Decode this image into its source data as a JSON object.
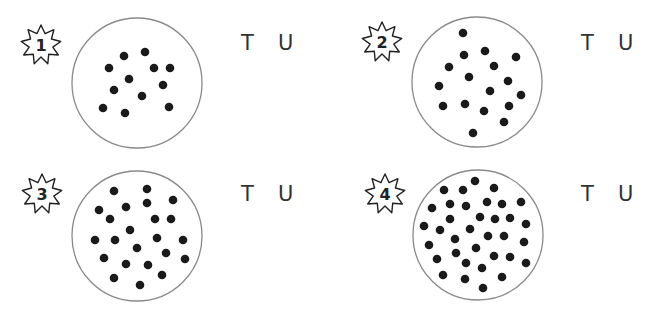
{
  "worksheet": {
    "colors": {
      "dot": "#1a1a1a",
      "circle_stroke": "#8a8a8a",
      "text": "#333333",
      "badge_stroke": "#222222"
    },
    "panels": [
      {
        "number": "1",
        "labels": {
          "tens": "T",
          "units": "U"
        },
        "dot_count": 12,
        "badge": {
          "cx": 41,
          "cy": 45
        },
        "circle": {
          "cx": 137,
          "cy": 83,
          "r": 65
        },
        "tu_pos": {
          "x": 241,
          "y": 31
        },
        "dots": [
          [
            124,
            56
          ],
          [
            145,
            52
          ],
          [
            109,
            68
          ],
          [
            154,
            68
          ],
          [
            170,
            68
          ],
          [
            129,
            79
          ],
          [
            163,
            85
          ],
          [
            114,
            90
          ],
          [
            142,
            96
          ],
          [
            103,
            108
          ],
          [
            125,
            113
          ],
          [
            169,
            107
          ]
        ]
      },
      {
        "number": "2",
        "labels": {
          "tens": "T",
          "units": "U"
        },
        "dot_count": 17,
        "badge": {
          "cx": 382,
          "cy": 42
        },
        "circle": {
          "cx": 477,
          "cy": 82,
          "r": 65
        },
        "tu_pos": {
          "x": 581,
          "y": 31
        },
        "dots": [
          [
            463,
            33
          ],
          [
            464,
            55
          ],
          [
            485,
            51
          ],
          [
            516,
            57
          ],
          [
            449,
            67
          ],
          [
            494,
            66
          ],
          [
            469,
            77
          ],
          [
            439,
            86
          ],
          [
            508,
            81
          ],
          [
            490,
            91
          ],
          [
            521,
            95
          ],
          [
            443,
            106
          ],
          [
            465,
            104
          ],
          [
            484,
            111
          ],
          [
            509,
            106
          ],
          [
            504,
            122
          ],
          [
            473,
            133
          ]
        ]
      },
      {
        "number": "3",
        "labels": {
          "tens": "T",
          "units": "U"
        },
        "dot_count": 23,
        "badge": {
          "cx": 42,
          "cy": 194
        },
        "circle": {
          "cx": 137,
          "cy": 236,
          "r": 65
        },
        "tu_pos": {
          "x": 241,
          "y": 182
        },
        "dots": [
          [
            114,
            191
          ],
          [
            147,
            189
          ],
          [
            173,
            200
          ],
          [
            99,
            210
          ],
          [
            126,
            207
          ],
          [
            147,
            203
          ],
          [
            110,
            219
          ],
          [
            155,
            219
          ],
          [
            171,
            219
          ],
          [
            130,
            230
          ],
          [
            95,
            240
          ],
          [
            115,
            240
          ],
          [
            157,
            238
          ],
          [
            183,
            240
          ],
          [
            137,
            248
          ],
          [
            166,
            253
          ],
          [
            104,
            258
          ],
          [
            126,
            264
          ],
          [
            148,
            265
          ],
          [
            185,
            259
          ],
          [
            114,
            278
          ],
          [
            162,
            275
          ],
          [
            140,
            285
          ]
        ]
      },
      {
        "number": "4",
        "labels": {
          "tens": "T",
          "units": "U"
        },
        "dot_count": 35,
        "badge": {
          "cx": 385,
          "cy": 194
        },
        "circle": {
          "cx": 478,
          "cy": 235,
          "r": 65
        },
        "tu_pos": {
          "x": 581,
          "y": 182
        },
        "dots": [
          [
            475,
            181
          ],
          [
            444,
            190
          ],
          [
            463,
            190
          ],
          [
            494,
            188
          ],
          [
            432,
            208
          ],
          [
            450,
            204
          ],
          [
            466,
            206
          ],
          [
            487,
            202
          ],
          [
            502,
            204
          ],
          [
            521,
            202
          ],
          [
            450,
            219
          ],
          [
            480,
            217
          ],
          [
            495,
            219
          ],
          [
            510,
            218
          ],
          [
            424,
            226
          ],
          [
            440,
            230
          ],
          [
            470,
            229
          ],
          [
            526,
            224
          ],
          [
            455,
            239
          ],
          [
            488,
            236
          ],
          [
            504,
            236
          ],
          [
            429,
            245
          ],
          [
            476,
            248
          ],
          [
            524,
            242
          ],
          [
            456,
            253
          ],
          [
            494,
            256
          ],
          [
            510,
            257
          ],
          [
            437,
            259
          ],
          [
            466,
            263
          ],
          [
            482,
            268
          ],
          [
            526,
            263
          ],
          [
            443,
            275
          ],
          [
            465,
            279
          ],
          [
            502,
            277
          ],
          [
            483,
            288
          ]
        ]
      }
    ]
  }
}
